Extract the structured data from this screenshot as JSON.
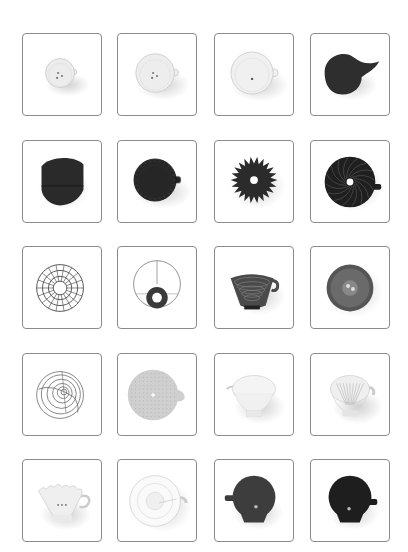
{
  "grid": {
    "columns": 4,
    "rows": 5,
    "col_x": [
      22,
      117,
      214,
      310
    ],
    "row_y": [
      33,
      140,
      246,
      353,
      459
    ],
    "card_width": 80,
    "card_height": 83,
    "border_color": "#8a8a8a"
  },
  "items": [
    {
      "name": "white-ceramic-dripper-small",
      "kind": "cup",
      "fill": "#ececec",
      "holes": 3,
      "handle": "right",
      "scale": 0.62
    },
    {
      "name": "white-ceramic-dripper-top",
      "kind": "cup",
      "fill": "#ededed",
      "holes": 3,
      "handle": "right",
      "scale": 0.82
    },
    {
      "name": "white-ceramic-dripper-large",
      "kind": "cup",
      "fill": "#f0f0f0",
      "holes": 1,
      "handle": "right",
      "scale": 0.9
    },
    {
      "name": "black-dripper-side",
      "kind": "blob",
      "fill": "#2e2e2e"
    },
    {
      "name": "black-dripper-folded",
      "kind": "folded",
      "fill": "#2a2a2a"
    },
    {
      "name": "black-dripper-ribbed-top",
      "kind": "cup",
      "fill": "#262626",
      "holes": 0,
      "handle": "right",
      "scale": 0.9
    },
    {
      "name": "black-flower-dripper",
      "kind": "flower",
      "fill": "#2b2b2b"
    },
    {
      "name": "black-spiral-dripper",
      "kind": "spiral",
      "fill": "#1f1f1f"
    },
    {
      "name": "wire-basket-dripper",
      "kind": "wire",
      "fill": "#555555"
    },
    {
      "name": "wire-cone-dripper",
      "kind": "wirecone",
      "fill": "#3a3a3a"
    },
    {
      "name": "metal-dripper-ridged",
      "kind": "metalcup",
      "fill": "#4a4a4a"
    },
    {
      "name": "metal-dripper-top",
      "kind": "metaltop",
      "fill": "#555555"
    },
    {
      "name": "wire-spiral-dripper",
      "kind": "wirespiral",
      "fill": "#666666"
    },
    {
      "name": "mesh-dripper-top",
      "kind": "mesh",
      "fill": "#cfcfcf"
    },
    {
      "name": "glass-dripper-side",
      "kind": "glass",
      "fill": "#e6e6e6"
    },
    {
      "name": "glass-dripper-ribbed",
      "kind": "glassrib",
      "fill": "#dcdcdc"
    },
    {
      "name": "white-wave-dripper",
      "kind": "wave",
      "fill": "#efefef"
    },
    {
      "name": "clear-plastic-dripper-top",
      "kind": "cleartop",
      "fill": "#e2e2e2"
    },
    {
      "name": "dark-gray-dripper",
      "kind": "darkcup",
      "fill": "#3d3d3d",
      "handle": "left"
    },
    {
      "name": "black-dripper-handle-right",
      "kind": "darkcup",
      "fill": "#1e1e1e",
      "handle": "right"
    }
  ]
}
